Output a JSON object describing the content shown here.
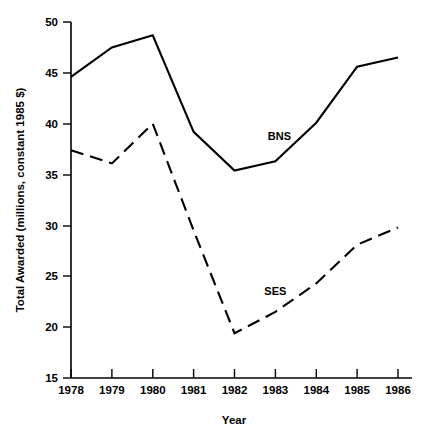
{
  "chart_data": {
    "type": "line",
    "title": "",
    "xlabel": "Year",
    "ylabel": "Total Awarded (millions, constant 1985 $)",
    "categories": [
      "1978",
      "1979",
      "1980",
      "1981",
      "1982",
      "1983",
      "1984",
      "1985",
      "1986"
    ],
    "x": [
      1978,
      1979,
      1980,
      1981,
      1982,
      1983,
      1984,
      1985,
      1986
    ],
    "xlim": [
      1978,
      1986
    ],
    "ylim": [
      15,
      50
    ],
    "yticks": [
      15,
      20,
      25,
      30,
      35,
      40,
      45,
      50
    ],
    "ytick_labels": [
      "15",
      "20",
      "25",
      "30",
      "35",
      "40",
      "45",
      "50"
    ],
    "xticks": [
      1978,
      1979,
      1980,
      1981,
      1982,
      1983,
      1984,
      1985,
      1986
    ],
    "xtick_labels": [
      "1978",
      "1979",
      "1980",
      "1981",
      "1982",
      "1983",
      "1984",
      "1985",
      "1986"
    ],
    "grid": false,
    "legend_position": "inline-annotation",
    "series": [
      {
        "name": "BNS",
        "style": "solid",
        "color": "#000000",
        "label_x": 1983.1,
        "label_y": 38.4,
        "values": [
          44.6,
          47.5,
          48.7,
          39.2,
          35.4,
          36.3,
          40.1,
          45.6,
          46.5
        ]
      },
      {
        "name": "SES",
        "style": "dashed",
        "color": "#000000",
        "label_x": 1983.0,
        "label_y": 23.2,
        "values": [
          37.4,
          36.1,
          40.0,
          29.5,
          19.4,
          21.5,
          24.3,
          28.1,
          29.8
        ]
      }
    ],
    "annotations": [
      {
        "text": "BNS",
        "series": "BNS"
      },
      {
        "text": "SES",
        "series": "SES"
      }
    ]
  },
  "axes": {
    "y_title": "Total Awarded (millions, constant 1985 $)",
    "x_title": "Year"
  },
  "colors": {
    "background": "#ffffff",
    "ink": "#000000"
  }
}
